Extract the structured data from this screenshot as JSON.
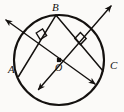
{
  "figure": {
    "kind": "circle-geometry-diagram",
    "background_color": "#fbfaf8",
    "stroke_color": "#14110f",
    "labels": {
      "center": "O",
      "point_a": "A",
      "point_b": "B",
      "point_c": "C"
    },
    "circle": {
      "center_x": 59,
      "center_y": 60,
      "radius": 45,
      "stroke_width": 2.1
    },
    "center_dot": {
      "x": 59,
      "y": 60,
      "size": 4,
      "shape": "filled-square"
    },
    "points": [
      {
        "name": "A",
        "x": 18.5,
        "y": 76.5
      },
      {
        "name": "B",
        "x": 56.0,
        "y": 15.2
      },
      {
        "name": "C",
        "x": 103.0,
        "y": 71.0
      }
    ],
    "chords": [
      {
        "name": "chord-BA",
        "x1": 56.0,
        "y1": 15.2,
        "x2": 18.5,
        "y2": 76.5
      },
      {
        "name": "chord-BC",
        "x1": 56.0,
        "y1": 15.2,
        "x2": 103.0,
        "y2": 71.0
      }
    ],
    "bisectors": [
      {
        "name": "perpendicular-bisector-of-BA",
        "x1": 6.0,
        "y1": 20.0,
        "x2": 95.0,
        "y2": 84.0,
        "arrow_start": true,
        "arrow_end": true
      },
      {
        "name": "perpendicular-bisector-of-BC",
        "x1": 111.0,
        "y1": 6.0,
        "x2": 38.5,
        "y2": 89.5,
        "arrow_start": true,
        "arrow_end": true
      }
    ],
    "right_angle_marks": [
      {
        "name": "right-angle-mark-left",
        "cx": 40.5,
        "cy": 37.0,
        "size": 9
      },
      {
        "name": "right-angle-mark-right",
        "cx": 80.0,
        "cy": 40.0,
        "size": 9
      }
    ]
  }
}
